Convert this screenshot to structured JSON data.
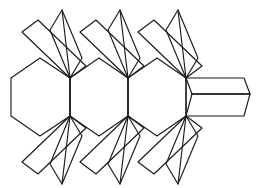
{
  "figure": {
    "title": "Geometric tessellation line drawing",
    "style": {
      "background_color": "#ffffff",
      "stroke_color": "#1a1a1a",
      "stroke_width": 1.15
    },
    "canvas": {
      "width": 258,
      "height": 188
    },
    "geometry": {
      "axis_y_top": 78,
      "axis_y_bottom": 116,
      "node_x": [
        70,
        128,
        186
      ],
      "hexagon": {
        "name": "left-hexagon",
        "points": "11,78 40,58 70,78 70,116 40,136 11,116"
      },
      "cell_hexagons": [
        {
          "name": "cell-hexagon-1",
          "points": "70,78 99,58 128,78 128,116 99,136 70,116"
        },
        {
          "name": "cell-hexagon-2",
          "points": "128,78 157,58 186,78 186,116 157,136 128,116"
        }
      ],
      "arrow_tip": {
        "name": "right-arrow-tip",
        "upper": "186,78 244,78 250,94 192,94",
        "lower": "186,116 244,116 250,94 192,94",
        "spine": "192,94 250,94",
        "tip_x": 250,
        "tip_y": 94
      },
      "top_petals": [
        {
          "name": "top-petal-1",
          "points": "70,78 50,30 62,10 82,58"
        },
        {
          "name": "top-petal-2",
          "points": "70,78 22,32 38,20 86,66"
        },
        {
          "name": "top-petal-3",
          "points": "128,78 108,30 120,10 140,58"
        },
        {
          "name": "top-petal-4",
          "points": "128,78 80,32 96,20 144,66"
        },
        {
          "name": "top-petal-5",
          "points": "186,78 166,30 178,10 198,58"
        },
        {
          "name": "top-petal-6",
          "points": "186,78 138,32 154,20 202,66"
        }
      ],
      "bottom_petals": [
        {
          "name": "bottom-petal-1",
          "points": "70,116 50,164 62,184 82,136"
        },
        {
          "name": "bottom-petal-2",
          "points": "70,116 22,162 38,174 86,128"
        },
        {
          "name": "bottom-petal-3",
          "points": "128,116 108,164 120,184 140,136"
        },
        {
          "name": "bottom-petal-4",
          "points": "128,116 80,162 96,174 144,128"
        },
        {
          "name": "bottom-petal-5",
          "points": "186,116 166,164 178,184 198,136"
        },
        {
          "name": "bottom-petal-6",
          "points": "186,116 138,162 154,174 202,128"
        }
      ],
      "vertical_spines": [
        {
          "name": "spine-top-1",
          "x1": 70,
          "y1": 78,
          "x2": 62,
          "y2": 10
        },
        {
          "name": "spine-top-2",
          "x1": 128,
          "y1": 78,
          "x2": 120,
          "y2": 10
        },
        {
          "name": "spine-top-3",
          "x1": 186,
          "y1": 78,
          "x2": 178,
          "y2": 10
        },
        {
          "name": "spine-bottom-1",
          "x1": 70,
          "y1": 116,
          "x2": 62,
          "y2": 184
        },
        {
          "name": "spine-bottom-2",
          "x1": 128,
          "y1": 116,
          "x2": 120,
          "y2": 184
        },
        {
          "name": "spine-bottom-3",
          "x1": 186,
          "y1": 116,
          "x2": 178,
          "y2": 184
        }
      ],
      "node_connectors": [
        {
          "name": "node-spine-1",
          "x1": 70,
          "y1": 78,
          "x2": 70,
          "y2": 116
        },
        {
          "name": "node-spine-2",
          "x1": 128,
          "y1": 78,
          "x2": 128,
          "y2": 116
        },
        {
          "name": "node-spine-3",
          "x1": 186,
          "y1": 78,
          "x2": 186,
          "y2": 116
        }
      ]
    }
  }
}
